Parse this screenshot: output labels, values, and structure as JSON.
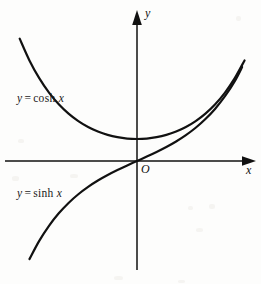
{
  "figure": {
    "background_color": "#fdfdfc",
    "ink_color": "#111111",
    "width": 261,
    "height": 284
  },
  "axes": {
    "y_axis_label": "y",
    "x_axis_label": "x",
    "origin_label": "O",
    "origin_px": {
      "x": 137,
      "y": 161
    },
    "x_axis_extent_px": {
      "from": 5,
      "to": 256
    },
    "y_axis_extent_px": {
      "from": 10,
      "to": 270
    },
    "arrowheads": [
      "y-axis-up",
      "x-axis-right"
    ],
    "tick_labels": [],
    "grid": false
  },
  "labels": {
    "cosh": {
      "lhs": "y",
      "eq": "=",
      "fn": "cosh",
      "arg": "x",
      "text": "y = cosh x"
    },
    "sinh": {
      "lhs": "y",
      "eq": "=",
      "fn": "sinh",
      "arg": "x",
      "text": "y = sinh x"
    }
  },
  "chart_data": {
    "type": "line",
    "title": "",
    "subtitle": "",
    "xlabel": "x",
    "ylabel": "y",
    "xlim": [
      -2.55,
      2.25
    ],
    "ylim": [
      -4.95,
      5.1
    ],
    "grid": false,
    "legend": "inline-curve-labels",
    "annotations": [
      {
        "text": "y = cosh x",
        "x": -2.1,
        "y": 2.35
      },
      {
        "text": "y = sinh x",
        "x": -2.1,
        "y": -1.45
      },
      {
        "text": "O",
        "x": 0.1,
        "y": -0.25
      }
    ],
    "series": [
      {
        "name": "y = cosh x",
        "equation": "y = cosh x",
        "color": "#111111",
        "x": [
          -2.4,
          -2.2,
          -2.0,
          -1.8,
          -1.6,
          -1.4,
          -1.2,
          -1.0,
          -0.8,
          -0.6,
          -0.4,
          -0.2,
          0.0,
          0.2,
          0.4,
          0.6,
          0.8,
          1.0,
          1.2,
          1.4,
          1.6,
          1.8,
          2.0,
          2.2
        ],
        "y": [
          5.557,
          4.568,
          3.762,
          3.107,
          2.577,
          2.151,
          1.811,
          1.543,
          1.337,
          1.185,
          1.081,
          1.02,
          1.0,
          1.02,
          1.081,
          1.185,
          1.337,
          1.543,
          1.811,
          2.151,
          2.577,
          3.107,
          3.762,
          4.568
        ]
      },
      {
        "name": "y = sinh x",
        "equation": "y = sinh x",
        "color": "#111111",
        "x": [
          -2.2,
          -2.0,
          -1.8,
          -1.6,
          -1.4,
          -1.2,
          -1.0,
          -0.8,
          -0.6,
          -0.4,
          -0.2,
          0.0,
          0.2,
          0.4,
          0.6,
          0.8,
          1.0,
          1.2,
          1.4,
          1.6,
          1.8,
          2.0,
          2.15
        ],
        "y": [
          -4.457,
          -3.627,
          -2.942,
          -2.376,
          -1.904,
          -1.509,
          -1.175,
          -0.888,
          -0.637,
          -0.411,
          -0.201,
          0.0,
          0.201,
          0.411,
          0.637,
          0.888,
          1.175,
          1.509,
          1.904,
          2.376,
          2.942,
          3.627,
          4.265
        ]
      }
    ]
  }
}
